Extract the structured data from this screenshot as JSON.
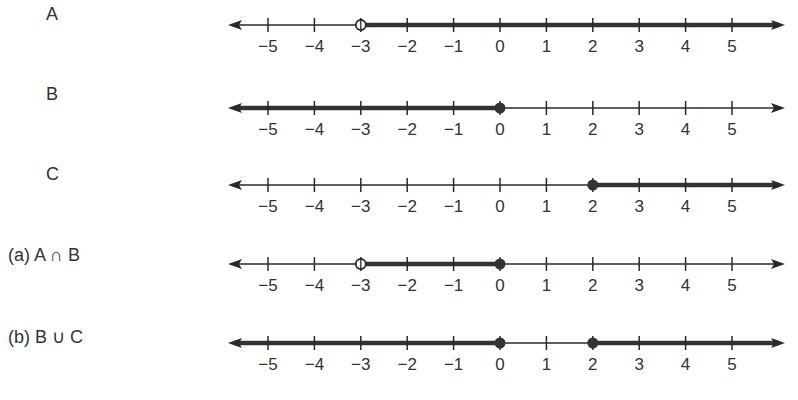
{
  "colors": {
    "ink": "#2a2a2a",
    "thick": "#333333",
    "background": "#ffffff"
  },
  "axis": {
    "ticks": [
      -5,
      -4,
      -3,
      -2,
      -1,
      0,
      1,
      2,
      3,
      4,
      5
    ],
    "tick_labels": [
      "−5",
      "−4",
      "−3",
      "−2",
      "−1",
      "0",
      "1",
      "2",
      "3",
      "4",
      "5"
    ],
    "x_start_px": 228,
    "x_end_px": 785,
    "px_zero": 500,
    "px_per_unit": 46.4
  },
  "rows": [
    {
      "label": "A",
      "description": "x > -3",
      "segments": [
        {
          "from": -3,
          "to": "inf"
        }
      ],
      "points": [
        {
          "x": -3,
          "type": "open"
        }
      ]
    },
    {
      "label": "B",
      "description": "x ≤ 0",
      "segments": [
        {
          "from": "-inf",
          "to": 0
        }
      ],
      "points": [
        {
          "x": 0,
          "type": "closed"
        }
      ]
    },
    {
      "label": "C",
      "description": "x ≥ 2",
      "segments": [
        {
          "from": 2,
          "to": "inf"
        }
      ],
      "points": [
        {
          "x": 2,
          "type": "closed"
        }
      ]
    },
    {
      "label": "(a) A ∩ B",
      "description": "-3 < x ≤ 0",
      "segments": [
        {
          "from": -3,
          "to": 0
        }
      ],
      "points": [
        {
          "x": -3,
          "type": "open"
        },
        {
          "x": 0,
          "type": "closed"
        }
      ]
    },
    {
      "label": "(b) B ∪ C",
      "description": "x ≤ 0 or x ≥ 2",
      "segments": [
        {
          "from": "-inf",
          "to": 0
        },
        {
          "from": 2,
          "to": "inf"
        }
      ],
      "points": [
        {
          "x": 0,
          "type": "closed"
        },
        {
          "x": 2,
          "type": "closed"
        }
      ]
    }
  ]
}
